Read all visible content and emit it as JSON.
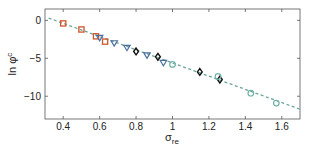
{
  "chart_data": {
    "type": "scatter",
    "title": "",
    "xlabel": "σ_re",
    "ylabel": "ln φ^c",
    "xlim": [
      0.3,
      1.7
    ],
    "ylim": [
      -13,
      1.5
    ],
    "xticks": [
      0.4,
      0.6,
      0.8,
      1,
      1.2,
      1.4,
      1.6
    ],
    "xtick_labels": [
      "0.4",
      "0.6",
      "0.8",
      "1",
      "1.2",
      "1.4",
      "1.6"
    ],
    "yticks": [
      0,
      -5,
      -10
    ],
    "ytick_labels": [
      "0",
      "−5",
      "−10"
    ],
    "grid": false,
    "legend": null,
    "series": [
      {
        "name": "squares",
        "marker": "square",
        "color": "#d0542c",
        "x": [
          0.4,
          0.5,
          0.58,
          0.63
        ],
        "y": [
          -0.4,
          -1.2,
          -2.1,
          -2.8
        ]
      },
      {
        "name": "triangles",
        "marker": "triangle-down",
        "color": "#4a6f9e",
        "x": [
          0.6,
          0.68,
          0.75,
          0.86,
          0.95
        ],
        "y": [
          -2.3,
          -3.0,
          -3.6,
          -4.6,
          -5.6
        ]
      },
      {
        "name": "diamonds",
        "marker": "diamond",
        "color": "#111111",
        "x": [
          0.8,
          0.92,
          1.15,
          1.26
        ],
        "y": [
          -4.1,
          -4.8,
          -6.8,
          -7.8
        ]
      },
      {
        "name": "circles",
        "marker": "circle",
        "color": "#6fb3a8",
        "x": [
          1.0,
          1.25,
          1.43,
          1.57
        ],
        "y": [
          -5.8,
          -7.4,
          -9.6,
          -10.9
        ]
      }
    ],
    "fit_line": {
      "style": "dashed",
      "color": "#6aa69a",
      "x": [
        0.32,
        1.7
      ],
      "y": [
        0.3,
        -11.7
      ]
    }
  }
}
